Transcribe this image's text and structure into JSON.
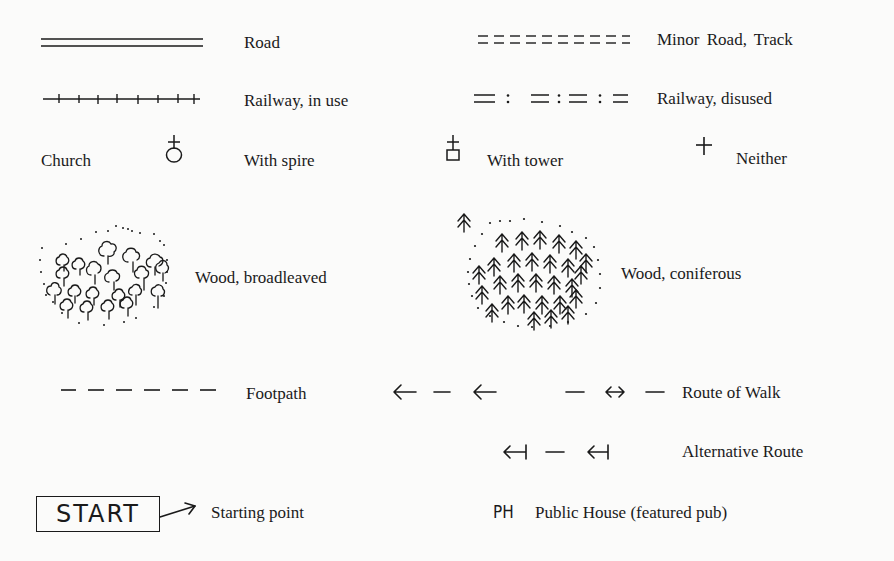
{
  "legend": {
    "rows": {
      "road": {
        "symbol": "double-line",
        "label": "Road"
      },
      "minor_road": {
        "symbol": "double-dashed-line",
        "label": "Minor Road, Track"
      },
      "railway_in_use": {
        "symbol": "line-with-ticks",
        "label": "Railway, in use"
      },
      "railway_disused": {
        "symbol": "double-dash-colon-line",
        "label": "Railway, disused"
      },
      "church": {
        "label": "Church",
        "with_spire": {
          "symbol": "circle-with-cross",
          "label": "With spire"
        },
        "with_tower": {
          "symbol": "square-with-cross",
          "label": "With tower"
        },
        "neither": {
          "symbol": "cross",
          "symbol_glyph": "+",
          "label": "Neither"
        }
      },
      "wood_broadleaved": {
        "symbol": "broadleaf-tree-cluster",
        "label": "Wood, broadleaved"
      },
      "wood_coniferous": {
        "symbol": "conifer-tree-cluster",
        "label": "Wood, coniferous"
      },
      "footpath": {
        "symbol": "dashed-line",
        "label": "Footpath"
      },
      "footpath_arrows": {
        "symbol": "left-arrow-dash-left-arrow"
      },
      "route_of_walk": {
        "symbol": "dash-double-arrow-dash",
        "label": "Route of Walk"
      },
      "alternative_route": {
        "symbol": "barred-left-arrow-dash",
        "label": "Alternative Route"
      },
      "starting_point": {
        "box_text": "START",
        "label": "Starting point"
      },
      "public_house": {
        "abbr": "PH",
        "label": "Public House (featured pub)"
      }
    }
  }
}
